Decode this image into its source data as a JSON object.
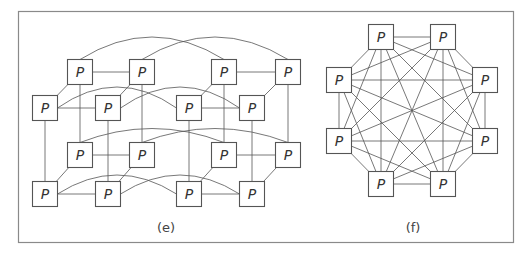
{
  "figure": {
    "panels": [
      {
        "id": "e",
        "caption": "(e)",
        "topology": "4D hypercube (two 3D cubes linked by arcs)",
        "node_label": "P",
        "node_count": 16
      },
      {
        "id": "f",
        "caption": "(f)",
        "topology": "fully connected (complete graph K8)",
        "node_label": "P",
        "node_count": 8
      }
    ]
  },
  "colors": {
    "frame": "#8a8a8a",
    "edge": "#555555",
    "node_border": "#555555",
    "text": "#333333"
  }
}
